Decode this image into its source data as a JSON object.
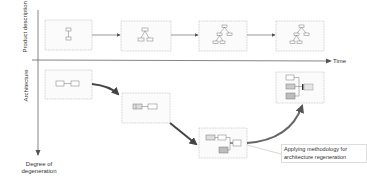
{
  "axes": {
    "product_label": "Product description",
    "architecture_label": "Architecture",
    "time_label": "Time",
    "degeneration_label": "Degree of degeneration"
  },
  "product_boxes": [
    {
      "id": 1,
      "icon": "single-component-icon"
    },
    {
      "id": 2,
      "icon": "small-tree-icon"
    },
    {
      "id": 3,
      "icon": "larger-tree-icon"
    },
    {
      "id": 4,
      "icon": "larger-tree-icon"
    }
  ],
  "architecture_boxes": [
    {
      "id": 1,
      "icon": "two-component-icon",
      "state": "initial"
    },
    {
      "id": 2,
      "icon": "degraded-components-icon",
      "state": "degrading"
    },
    {
      "id": 3,
      "icon": "complex-components-icon",
      "state": "degenerated"
    },
    {
      "id": 4,
      "icon": "regenerated-components-icon",
      "state": "regenerated"
    }
  ],
  "callout": {
    "text": "Applying methodology for architecture regeneration"
  },
  "colors": {
    "box_border": "#bbbbbb",
    "box_fill": "#fbfbfb",
    "arrow": "#444444",
    "axis": "#555555",
    "shaded_component": "#bdbdbd"
  }
}
